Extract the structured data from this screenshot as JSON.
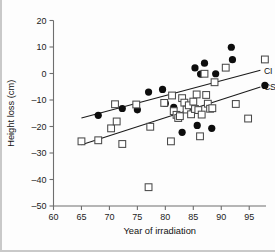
{
  "chart_data": {
    "type": "scatter",
    "title": "",
    "xlabel": "Year of irradiation",
    "ylabel": "Height loss (cm)",
    "xlim": [
      60,
      98
    ],
    "ylim": [
      -50,
      20
    ],
    "xticks": [
      60,
      65,
      70,
      75,
      80,
      85,
      90,
      95
    ],
    "yticks": [
      20,
      10,
      0,
      -10,
      -20,
      -30,
      -40,
      -50
    ],
    "grid": false,
    "legend_position": "right-inline",
    "series": [
      {
        "name": "CI",
        "marker": "filled-circle",
        "label": "CI",
        "points": [
          [
            68.0,
            -15.8
          ],
          [
            72.3,
            -13.2
          ],
          [
            75.0,
            -13.7
          ],
          [
            77.0,
            -7.0
          ],
          [
            79.5,
            -6.0
          ],
          [
            80.0,
            -11.3
          ],
          [
            81.5,
            -12.8
          ],
          [
            83.0,
            -22.2
          ],
          [
            85.3,
            2.1
          ],
          [
            85.7,
            -19.6
          ],
          [
            86.3,
            -0.2
          ],
          [
            87.0,
            3.9
          ],
          [
            88.3,
            -20.7
          ],
          [
            89.0,
            -0.1
          ],
          [
            91.8,
            9.9
          ],
          [
            92.0,
            5.2
          ],
          [
            97.8,
            -4.5
          ]
        ],
        "trendline": {
          "x1": 65.0,
          "y1": -16.8,
          "x2": 97.0,
          "y2": 1.2
        }
      },
      {
        "name": "CSI",
        "marker": "open-square",
        "label": "CSI",
        "points": [
          [
            65.0,
            -25.6
          ],
          [
            68.0,
            -25.2
          ],
          [
            70.3,
            -20.7
          ],
          [
            71.0,
            -11.6
          ],
          [
            71.3,
            -18.1
          ],
          [
            72.3,
            -26.6
          ],
          [
            74.8,
            -11.7
          ],
          [
            77.0,
            -42.9
          ],
          [
            77.3,
            -20.1
          ],
          [
            79.8,
            -11.1
          ],
          [
            81.0,
            -25.6
          ],
          [
            81.2,
            -8.3
          ],
          [
            81.5,
            -14.2
          ],
          [
            82.0,
            -15.6
          ],
          [
            82.3,
            -16.8
          ],
          [
            82.6,
            -16.1
          ],
          [
            83.0,
            -9.3
          ],
          [
            83.4,
            -11.0
          ],
          [
            83.8,
            -13.6
          ],
          [
            84.2,
            -12.0
          ],
          [
            84.6,
            -15.4
          ],
          [
            85.0,
            -10.6
          ],
          [
            85.3,
            -13.4
          ],
          [
            85.6,
            -7.9
          ],
          [
            85.9,
            -13.8
          ],
          [
            86.2,
            -23.7
          ],
          [
            86.5,
            -15.5
          ],
          [
            87.0,
            -0.1
          ],
          [
            87.3,
            -8.1
          ],
          [
            87.6,
            -11.4
          ],
          [
            88.0,
            -13.3
          ],
          [
            88.4,
            -13.1
          ],
          [
            88.8,
            -3.3
          ],
          [
            90.8,
            2.2
          ],
          [
            92.6,
            -11.5
          ],
          [
            94.8,
            -17.0
          ],
          [
            97.8,
            5.3
          ]
        ],
        "trendline": {
          "x1": 65.0,
          "y1": -26.9,
          "x2": 97.0,
          "y2": -5.1
        }
      }
    ]
  }
}
